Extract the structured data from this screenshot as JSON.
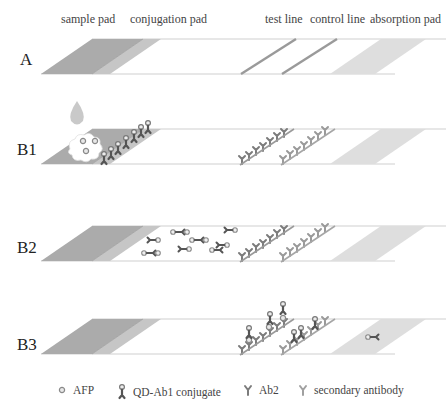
{
  "headers": {
    "sample_pad": "sample pad",
    "conjugation_pad": "conjugation pad",
    "test_line": "test line",
    "control_line": "control line",
    "absorption_pad": "absorption pad"
  },
  "rows": [
    {
      "label": "A",
      "state": "empty strip"
    },
    {
      "label": "B1",
      "state": "sample applied; AFP binds QD-Ab1 conjugate"
    },
    {
      "label": "B2",
      "state": "complexes migrate along membrane"
    },
    {
      "label": "B3",
      "state": "complexes captured at test and control lines"
    }
  ],
  "legend": {
    "afp": "AFP",
    "conjugate": "QD-Ab1 conjugate",
    "ab2": "Ab2",
    "secondary": "secondary antibody"
  },
  "colors": {
    "sample_pad": "#a9a9a9",
    "conjugation_pad": "#c4c4c4",
    "absorption_pad": "#dcdcdc",
    "line": "#9a9a9a",
    "strip_edge": "#cfcfcf",
    "conjugate": "#555555",
    "antibody": "#8a8a8a",
    "drop": "#c8c8c8"
  }
}
